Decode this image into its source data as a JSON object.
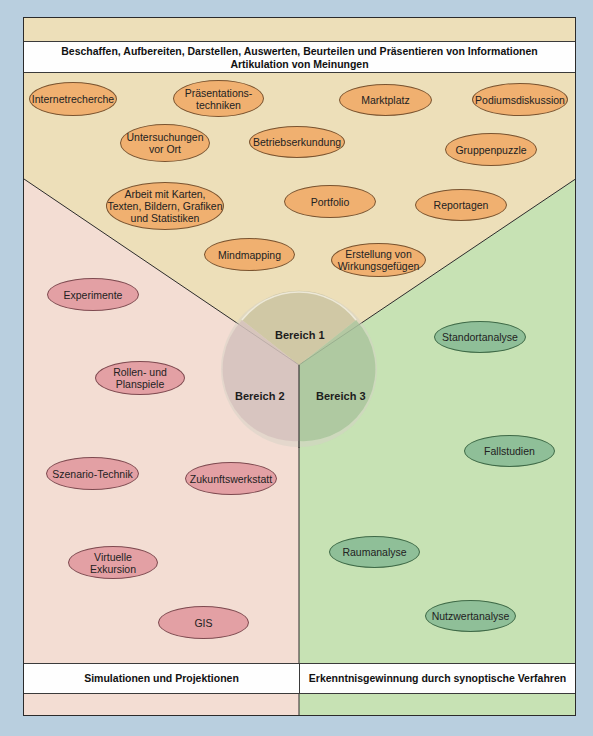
{
  "header": {
    "line1": "Beschaffen, Aufbereiten, Darstellen, Auswerten, Beurteilen und Präsentieren von Informationen",
    "line2": "Artikulation von Meinungen"
  },
  "footer": {
    "left": "Simulationen und Projektionen",
    "right": "Erkenntnisgewinnung durch synoptische Verfahren"
  },
  "center": {
    "bereich1": "Bereich 1",
    "bereich2": "Bereich 2",
    "bereich3": "Bereich 3"
  },
  "colors": {
    "background": "#b9cfdf",
    "area1": "#eddfb9",
    "area2": "#f3ddd3",
    "area3": "#c7e2b4",
    "orange_ellipse": "#f0b070",
    "pink_ellipse": "#e3a0a4",
    "green_ellipse": "#8fbf98"
  },
  "area1_items": [
    {
      "l1": "Internetrecherche",
      "l2": ""
    },
    {
      "l1": "Präsentations-",
      "l2": "techniken"
    },
    {
      "l1": "Marktplatz",
      "l2": ""
    },
    {
      "l1": "Podiumsdiskussion",
      "l2": ""
    },
    {
      "l1": "Untersuchungen",
      "l2": "vor Ort"
    },
    {
      "l1": "Betriebserkundung",
      "l2": ""
    },
    {
      "l1": "Gruppenpuzzle",
      "l2": ""
    },
    {
      "l1": "Arbeit mit Karten,",
      "l2": "Texten, Bildern, Grafiken",
      "l3": "und Statistiken"
    },
    {
      "l1": "Portfolio",
      "l2": ""
    },
    {
      "l1": "Reportagen",
      "l2": ""
    },
    {
      "l1": "Mindmapping",
      "l2": ""
    },
    {
      "l1": "Erstellung von",
      "l2": "Wirkungsgefügen"
    }
  ],
  "area2_items": [
    {
      "l1": "Experimente",
      "l2": ""
    },
    {
      "l1": "Rollen- und",
      "l2": "Planspiele"
    },
    {
      "l1": "Szenario-Technik",
      "l2": ""
    },
    {
      "l1": "Zukunftswerkstatt",
      "l2": ""
    },
    {
      "l1": "Virtuelle",
      "l2": "Exkursion"
    },
    {
      "l1": "GIS",
      "l2": ""
    }
  ],
  "area3_items": [
    {
      "l1": "Standortanalyse",
      "l2": ""
    },
    {
      "l1": "Fallstudien",
      "l2": ""
    },
    {
      "l1": "Raumanalyse",
      "l2": ""
    },
    {
      "l1": "Nutzwertanalyse",
      "l2": ""
    }
  ]
}
